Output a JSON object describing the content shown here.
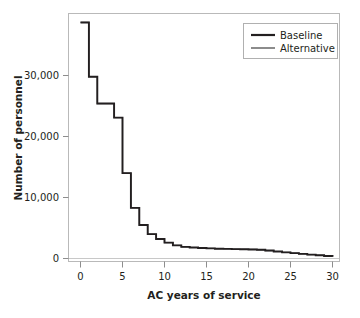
{
  "chart_data": {
    "type": "line",
    "title": "",
    "xlabel": "AC years of service",
    "ylabel": "Number of personnel",
    "xlim": [
      0,
      30
    ],
    "ylim": [
      0,
      40000
    ],
    "xticks": [
      0,
      5,
      10,
      15,
      20,
      25,
      30
    ],
    "xtick_labels": [
      "0",
      "5",
      "10",
      "15",
      "20",
      "25",
      "30"
    ],
    "yticks": [
      0,
      10000,
      20000,
      30000
    ],
    "ytick_labels": [
      "0",
      "10,000",
      "20,000",
      "30,000"
    ],
    "grid": false,
    "drawstyle": "steps-post",
    "legend_position": "upper right",
    "x": [
      0,
      1,
      2,
      3,
      4,
      5,
      6,
      7,
      8,
      9,
      10,
      11,
      12,
      13,
      14,
      15,
      16,
      17,
      18,
      19,
      20,
      21,
      22,
      23,
      24,
      25,
      26,
      27,
      28,
      29,
      30
    ],
    "series": [
      {
        "name": "Baseline",
        "color": "#231f20",
        "values": [
          38700,
          29800,
          25400,
          25400,
          23100,
          14000,
          8300,
          5500,
          4000,
          3200,
          2600,
          2150,
          1900,
          1800,
          1720,
          1660,
          1610,
          1570,
          1540,
          1510,
          1480,
          1430,
          1300,
          1150,
          1000,
          880,
          760,
          640,
          530,
          420,
          300
        ]
      },
      {
        "name": "Alternative",
        "color": "#6f6f6f",
        "values": [
          38700,
          29800,
          25400,
          25400,
          23100,
          14000,
          8300,
          5500,
          4000,
          3200,
          2600,
          2150,
          1900,
          1800,
          1720,
          1660,
          1610,
          1570,
          1540,
          1510,
          1480,
          1430,
          1300,
          1150,
          1000,
          880,
          760,
          640,
          530,
          420,
          300
        ]
      }
    ]
  },
  "legend": {
    "entries": [
      {
        "label": "Baseline"
      },
      {
        "label": "Alternative"
      }
    ]
  }
}
